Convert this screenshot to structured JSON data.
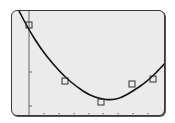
{
  "calculator_screen": {
    "background_color": "#ebebeb",
    "border_color": "#3a3a3a",
    "curve_color": "#111111",
    "marker_color": "#333333",
    "axis_color": "#666666"
  },
  "chart_data": {
    "type": "scatter",
    "title": "",
    "xlabel": "",
    "ylabel": "",
    "grid": false,
    "legend": "none",
    "x_ticks_count": 8,
    "y_ticks_count": 2,
    "plot_box_px": {
      "x0": 28,
      "x1": 166,
      "y0": 11,
      "y1": 114
    },
    "series": [
      {
        "name": "data points",
        "marker": "square",
        "points_px": [
          [
            28,
            24
          ],
          [
            64,
            80
          ],
          [
            100,
            101
          ],
          [
            131,
            83
          ],
          [
            152,
            78
          ]
        ]
      },
      {
        "name": "quadratic regression",
        "style": "line",
        "curve_px": [
          [
            18,
            10
          ],
          [
            28,
            29
          ],
          [
            40,
            48
          ],
          [
            52,
            63
          ],
          [
            64,
            76
          ],
          [
            76,
            86
          ],
          [
            88,
            94
          ],
          [
            100,
            98
          ],
          [
            110,
            99
          ],
          [
            120,
            97
          ],
          [
            132,
            90
          ],
          [
            144,
            82
          ],
          [
            155,
            72
          ],
          [
            165,
            61
          ]
        ]
      }
    ],
    "axes": {
      "y_axis_x_px": 28,
      "x_tick_positions_px": [
        43,
        58,
        73,
        88,
        102,
        117,
        132,
        147
      ],
      "y_tick_positions_px": [
        71,
        105
      ]
    }
  }
}
